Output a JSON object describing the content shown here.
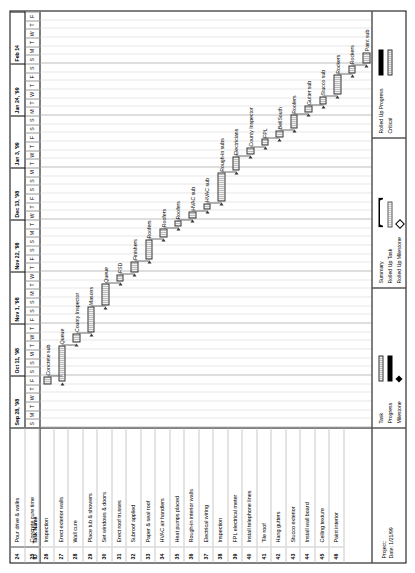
{
  "document": {
    "type": "gantt-chart",
    "orientation": "landscape-rotated"
  },
  "footer": {
    "project_label": "Project:",
    "date_label": "Date: 1/21/99"
  },
  "table": {
    "headers": {
      "id": "ID",
      "name": "Task Name"
    },
    "rows": [
      {
        "id": "24",
        "name": "Pour drive & walks"
      },
      {
        "id": "25",
        "name": "Concrete cure time"
      },
      {
        "id": "26",
        "name": "Inspection"
      },
      {
        "id": "27",
        "name": "Erect exterior walls"
      },
      {
        "id": "28",
        "name": "Wall cure"
      },
      {
        "id": "29",
        "name": "Place tub & showers"
      },
      {
        "id": "30",
        "name": "Set windows & doors"
      },
      {
        "id": "31",
        "name": "Erect roof trusses"
      },
      {
        "id": "32",
        "name": "Subroof applied"
      },
      {
        "id": "33",
        "name": "Paper & seal roof"
      },
      {
        "id": "34",
        "name": "HVAC air handlers"
      },
      {
        "id": "35",
        "name": "Heat pumps placed"
      },
      {
        "id": "36",
        "name": "Rough-in interior walls"
      },
      {
        "id": "37",
        "name": "Electrical wiring"
      },
      {
        "id": "38",
        "name": "Inspection"
      },
      {
        "id": "39",
        "name": "FPL electrical meter"
      },
      {
        "id": "40",
        "name": "Install telephone lines"
      },
      {
        "id": "41",
        "name": "Tile roof"
      },
      {
        "id": "42",
        "name": "Hang gutters"
      },
      {
        "id": "43",
        "name": "Stucco exterior"
      },
      {
        "id": "44",
        "name": "Install wall board"
      },
      {
        "id": "45",
        "name": "Ceiling texture"
      },
      {
        "id": "46",
        "name": "Paint interior"
      }
    ]
  },
  "timeline": {
    "major_ticks": [
      {
        "label": "Sep 28, '98"
      },
      {
        "label": "Oct 11, '98"
      },
      {
        "label": "Nov 1, '98"
      },
      {
        "label": "Nov 22, '98"
      },
      {
        "label": "Dec 13, '98"
      },
      {
        "label": "Jan 3, '99"
      },
      {
        "label": "Jan 24, '99"
      },
      {
        "label": "Feb 14"
      }
    ],
    "minor_ticks": [
      "S",
      "M",
      "T",
      "W",
      "T",
      "F",
      "S",
      "S",
      "M",
      "T",
      "W",
      "T",
      "F",
      "S",
      "S",
      "M",
      "T",
      "W",
      "T",
      "F",
      "S",
      "S",
      "M",
      "T",
      "W",
      "T",
      "F",
      "S",
      "S",
      "M",
      "T",
      "W",
      "T",
      "F",
      "S",
      "S",
      "M",
      "T",
      "W",
      "T",
      "F",
      "S",
      "S",
      "M",
      "T",
      "W",
      "T",
      "F"
    ]
  },
  "chart_data": {
    "type": "bar",
    "xlabel": "",
    "ylabel": "",
    "bars": [
      {
        "id": "24",
        "task": "Pour drive & walks",
        "start": 5.0,
        "length": 0.9,
        "label": "Concrete sub",
        "milestone": false
      },
      {
        "id": "25",
        "task": "Concrete cure time",
        "start": 5.3,
        "length": 4.2,
        "label": "Queue",
        "milestone": false
      },
      {
        "id": "26",
        "task": "Inspection",
        "start": 9.8,
        "length": 1.1,
        "label": "County Inspector",
        "milestone": false
      },
      {
        "id": "27",
        "task": "Erect exterior walls",
        "start": 11.0,
        "length": 3.0,
        "label": "Masons",
        "milestone": false
      },
      {
        "id": "28",
        "task": "Wall cure",
        "start": 14.1,
        "length": 2.5,
        "label": "Queue",
        "milestone": false
      },
      {
        "id": "29",
        "task": "Place tub & showers",
        "start": 16.8,
        "length": 0.9,
        "label": "FSD",
        "milestone": false
      },
      {
        "id": "30",
        "task": "Set windows & doors",
        "start": 17.9,
        "length": 1.3,
        "label": "Finishers",
        "milestone": false
      },
      {
        "id": "31",
        "task": "Erect roof trusses",
        "start": 19.4,
        "length": 2.3,
        "label": "Roofers",
        "milestone": false
      },
      {
        "id": "32",
        "task": "Subroof applied",
        "start": 21.9,
        "length": 1.1,
        "label": "Roofers",
        "milestone": false
      },
      {
        "id": "33",
        "task": "Paper & seal roof",
        "start": 23.2,
        "length": 0.7,
        "label": "Roofers",
        "milestone": false
      },
      {
        "id": "34",
        "task": "HVAC air handlers",
        "start": 24.1,
        "length": 0.8,
        "label": "HVAC sub",
        "milestone": false
      },
      {
        "id": "35",
        "task": "Heat pumps placed",
        "start": 25.1,
        "length": 0.8,
        "label": "HVAC sub",
        "milestone": false
      },
      {
        "id": "36",
        "task": "Rough-in interior walls",
        "start": 26.1,
        "length": 3.3,
        "label": "Rough-in subs",
        "milestone": false
      },
      {
        "id": "37",
        "task": "Electrical wiring",
        "start": 29.6,
        "length": 1.7,
        "label": "Electricians",
        "milestone": false
      },
      {
        "id": "38",
        "task": "Inspection",
        "start": 31.5,
        "length": 0.8,
        "label": "County Inspector",
        "milestone": false
      },
      {
        "id": "39",
        "task": "FPL electrical meter",
        "start": 32.5,
        "length": 0.8,
        "label": "FPL",
        "milestone": false
      },
      {
        "id": "40",
        "task": "Install telephone lines",
        "start": 33.5,
        "length": 0.8,
        "label": "BellSouth",
        "milestone": false
      },
      {
        "id": "41",
        "task": "Tile roof",
        "start": 34.5,
        "length": 1.6,
        "label": "Roofers",
        "milestone": false
      },
      {
        "id": "42",
        "task": "Hang gutters",
        "start": 36.3,
        "length": 0.8,
        "label": "Gutter sub",
        "milestone": false
      },
      {
        "id": "43",
        "task": "Stucco exterior",
        "start": 37.3,
        "length": 0.9,
        "label": "Stucco sub",
        "milestone": false
      },
      {
        "id": "44",
        "task": "Install wall board",
        "start": 38.4,
        "length": 2.3,
        "label": "Rockers",
        "milestone": false
      },
      {
        "id": "45",
        "task": "Ceiling texture",
        "start": 40.9,
        "length": 0.9,
        "label": "Rockers",
        "milestone": false
      },
      {
        "id": "46",
        "task": "Paint interior",
        "start": 42.0,
        "length": 1.3,
        "label": "Paint sub",
        "milestone": false
      }
    ]
  },
  "legend": {
    "items": [
      {
        "label": "Task",
        "swatch": "task"
      },
      {
        "label": "Progress",
        "swatch": "progress"
      },
      {
        "label": "Milestone",
        "swatch": "milestone"
      },
      {
        "label": "Summary",
        "swatch": "summary"
      },
      {
        "label": "Rolled Up Task",
        "swatch": "rolled-up-task"
      },
      {
        "label": "Rolled Up Milestone",
        "swatch": "rolled-up-milestone"
      },
      {
        "label": "Rolled Up Progress",
        "swatch": "rolled-up-progress"
      },
      {
        "label": "Critical",
        "swatch": "critical"
      }
    ]
  }
}
